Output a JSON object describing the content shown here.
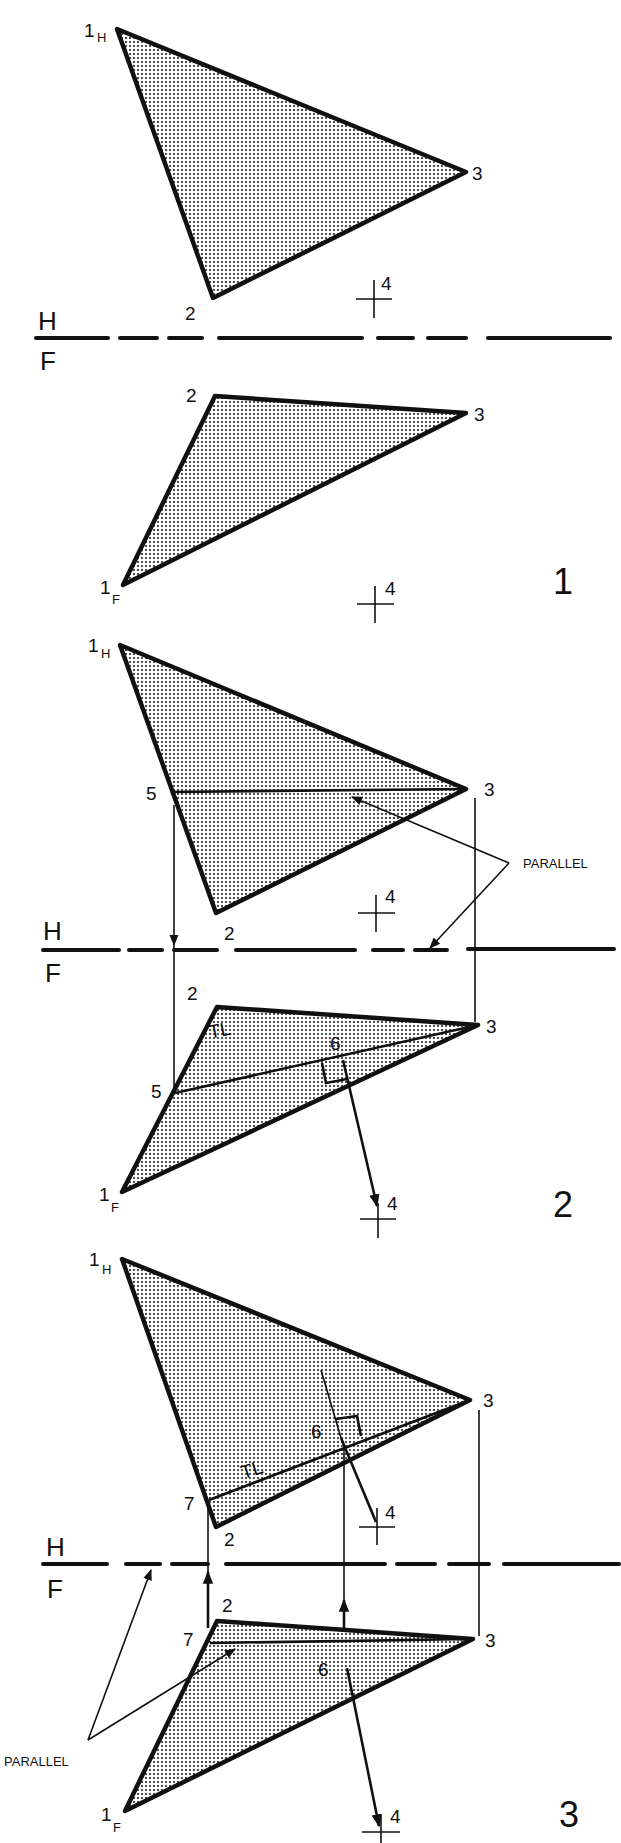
{
  "figure": {
    "type": "descriptive-geometry-construction",
    "fold_line": {
      "upper": "H",
      "lower": "F"
    },
    "panels": [
      {
        "number": "1",
        "horizontal_view": {
          "vertices": {
            "1": "1",
            "1_sub": "H",
            "2": "2",
            "3": "3"
          },
          "point": "4"
        },
        "front_view": {
          "vertices": {
            "1": "1",
            "1_sub": "F",
            "2": "2",
            "3": "3"
          },
          "point": "4"
        }
      },
      {
        "number": "2",
        "horizontal_view": {
          "vertices": {
            "1": "1",
            "1_sub": "H",
            "2": "2",
            "3": "3",
            "5": "5"
          },
          "point": "4"
        },
        "front_view": {
          "vertices": {
            "1": "1",
            "1_sub": "F",
            "2": "2",
            "3": "3",
            "5": "5",
            "6": "6"
          },
          "point": "4",
          "true_length": "TL"
        },
        "annotation": "PARALLEL"
      },
      {
        "number": "3",
        "horizontal_view": {
          "vertices": {
            "1": "1",
            "1_sub": "H",
            "2": "2",
            "3": "3",
            "7": "7",
            "6": "6"
          },
          "point": "4",
          "true_length": "TL"
        },
        "front_view": {
          "vertices": {
            "1": "1",
            "1_sub": "F",
            "2": "2",
            "3": "3",
            "7": "7",
            "6": "6"
          },
          "point": "4"
        },
        "annotation": "PARALLEL"
      }
    ]
  }
}
